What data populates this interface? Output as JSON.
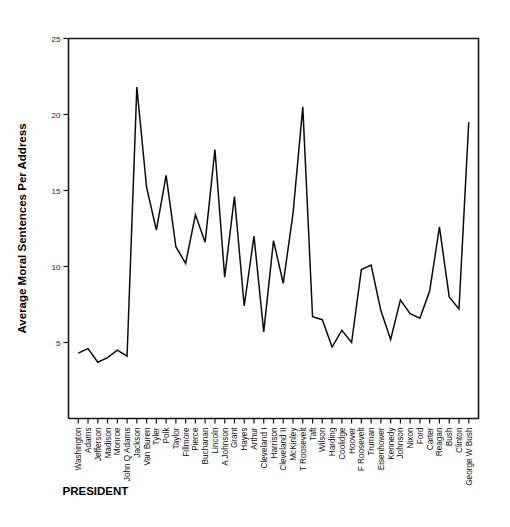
{
  "chart_data": {
    "type": "line",
    "title": "",
    "xlabel": "PRESIDENT",
    "ylabel": "Average Moral Sentences Per Address",
    "ylim": [
      0,
      25
    ],
    "yticks": [
      0,
      5,
      10,
      15,
      20,
      25
    ],
    "ytick_labels": [
      "",
      "5",
      "10",
      "15",
      "20",
      "25"
    ],
    "grid": false,
    "legend": false,
    "categories": [
      "Washington",
      "Adams",
      "Jefferson",
      "Madison",
      "Monroe",
      "John Q Adams",
      "Jackson",
      "Van Buren",
      "Tyler",
      "Polk",
      "Taylor",
      "Fillmore",
      "Pierce",
      "Buchanan",
      "Lincoln",
      "A Johnson",
      "Grant",
      "Hayes",
      "Arthur",
      "Cleveland I",
      "Harrison",
      "Cleveland II",
      "McKinley",
      "T Roosevelt",
      "Taft",
      "Wilson",
      "Harding",
      "Coolidge",
      "Hoover",
      "F Roosevelt",
      "Truman",
      "Eisenhower",
      "Kennedy",
      "Johnson",
      "Nixon",
      "Ford",
      "Carter",
      "Reagan",
      "Bush",
      "Clinton",
      "George W Bush"
    ],
    "values": [
      4.3,
      4.6,
      3.7,
      4.0,
      4.5,
      4.1,
      21.8,
      15.2,
      12.4,
      16.0,
      11.3,
      10.2,
      13.4,
      11.6,
      17.7,
      9.3,
      14.6,
      7.4,
      12.0,
      5.7,
      11.7,
      8.9,
      13.5,
      20.5,
      6.7,
      6.5,
      4.7,
      5.8,
      5.0,
      9.8,
      10.1,
      7.1,
      5.2,
      7.8,
      6.9,
      6.6,
      8.4,
      12.6,
      8.0,
      7.2,
      19.5
    ]
  },
  "axis": {
    "y_title": "Average Moral Sentences Per Address",
    "x_title": "PRESIDENT"
  },
  "colors": {
    "line": "#0b0b0b",
    "frame": "#151515",
    "text": "#111111",
    "background": "#ffffff"
  }
}
